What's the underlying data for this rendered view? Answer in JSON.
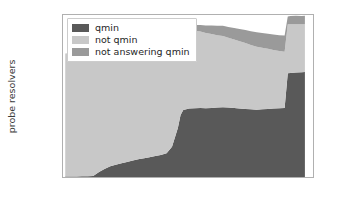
{
  "chart_data": {
    "type": "area",
    "stacked": true,
    "title": "",
    "xlabel": "",
    "ylabel": "probe resolvers",
    "xlim": [
      2017.45,
      2023.0
    ],
    "ylim": [
      0,
      22500
    ],
    "xticks": [
      "2018",
      "2019",
      "2020",
      "2021",
      "2022",
      "2023"
    ],
    "xtick_values": [
      2018,
      2019,
      2020,
      2021,
      2022,
      2023
    ],
    "yticks": [
      "0",
      "5000",
      "10000",
      "15000",
      "20000"
    ],
    "ytick_values": [
      0,
      5000,
      10000,
      15000,
      20000
    ],
    "grid": false,
    "legend_position": "upper left",
    "colors": {
      "qmin": "#595959",
      "not_qmin": "#c8c8c8",
      "not_answering_qmin": "#9a9a9a",
      "axis": "#b0b0b0",
      "text": "#3b3b3b",
      "background": "#ffffff"
    },
    "x": [
      2017.5,
      2017.62,
      2017.75,
      2017.87,
      2018.0,
      2018.12,
      2018.25,
      2018.37,
      2018.5,
      2018.62,
      2018.75,
      2018.87,
      2019.0,
      2019.12,
      2019.25,
      2019.37,
      2019.5,
      2019.62,
      2019.75,
      2019.87,
      2020.0,
      2020.06,
      2020.12,
      2020.25,
      2020.37,
      2020.5,
      2020.62,
      2020.75,
      2020.87,
      2021.0,
      2021.12,
      2021.25,
      2021.37,
      2021.5,
      2021.62,
      2021.75,
      2021.87,
      2022.0,
      2022.12,
      2022.25,
      2022.37,
      2022.44,
      2022.5,
      2022.62,
      2022.75,
      2022.82
    ],
    "series": [
      {
        "name": "qmin",
        "color": "#595959",
        "values": [
          60,
          70,
          80,
          90,
          110,
          140,
          700,
          1100,
          1500,
          1700,
          1900,
          2100,
          2300,
          2450,
          2600,
          2750,
          2900,
          3050,
          3300,
          4200,
          6800,
          8600,
          9300,
          9500,
          9550,
          9600,
          9550,
          9600,
          9650,
          9700,
          9650,
          9600,
          9500,
          9450,
          9400,
          9350,
          9400,
          9450,
          9500,
          9550,
          9600,
          14400,
          14450,
          14500,
          14550,
          14600
        ]
      },
      {
        "name": "not qmin",
        "color": "#c8c8c8",
        "values": [
          17100,
          17150,
          17200,
          17250,
          17300,
          17400,
          16900,
          16600,
          16400,
          16300,
          16250,
          16200,
          16150,
          16100,
          16050,
          16000,
          15950,
          15900,
          15700,
          15000,
          13300,
          11700,
          11200,
          11000,
          10800,
          10600,
          10450,
          10250,
          10050,
          9900,
          9700,
          9500,
          9350,
          9150,
          8950,
          8750,
          8550,
          8350,
          8150,
          7950,
          7800,
          6800,
          6750,
          6700,
          6650,
          6600
        ]
      },
      {
        "name": "not answering qmin",
        "color": "#9a9a9a",
        "values": [
          0,
          0,
          0,
          0,
          0,
          0,
          0,
          0,
          0,
          0,
          0,
          0,
          0,
          0,
          0,
          0,
          0,
          0,
          0,
          50,
          200,
          350,
          450,
          600,
          750,
          900,
          1050,
          1200,
          1300,
          1400,
          1500,
          1600,
          1700,
          1800,
          1900,
          2000,
          2050,
          2100,
          2150,
          2200,
          2250,
          1100,
          1150,
          1200,
          1150,
          1200
        ]
      }
    ],
    "legend": [
      {
        "label": "qmin",
        "color": "#595959"
      },
      {
        "label": "not qmin",
        "color": "#c8c8c8"
      },
      {
        "label": "not answering qmin",
        "color": "#9a9a9a"
      }
    ]
  }
}
